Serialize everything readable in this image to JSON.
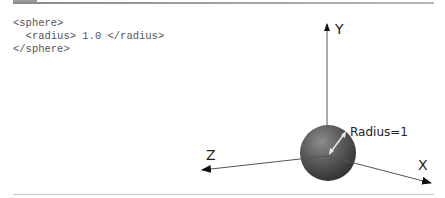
{
  "code_snippet": {
    "lines": [
      "<sphere>",
      "  <radius> 1.0 </radius>",
      "</sphere>"
    ]
  },
  "diagram": {
    "axes": {
      "y_label": "Y",
      "x_label": "X",
      "z_label": "Z"
    },
    "radius_label": "Radius=1",
    "colors": {
      "sphere": "#5a5a5a",
      "axis": "#555555",
      "rule": "#9a9a9a"
    }
  }
}
